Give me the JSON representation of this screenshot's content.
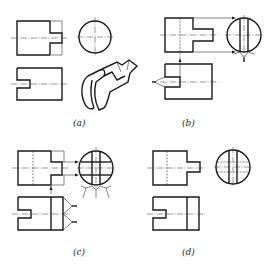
{
  "figure": {
    "type": "orthographic-projection-drawing",
    "panels": [
      {
        "id": "a",
        "label": "(a)",
        "description": "Front view, side (circular) view, top view and pictorial of cylinder with tenon and slot"
      },
      {
        "id": "b",
        "label": "(b)",
        "description": "Projection of tenon cut planes onto side view"
      },
      {
        "id": "c",
        "label": "(c)",
        "description": "Projection of full cut lines onto side view"
      },
      {
        "id": "d",
        "label": "(d)",
        "description": "Completed three views"
      }
    ],
    "colors": {
      "line": "#1a1a1a",
      "background": "#ffffff"
    }
  }
}
